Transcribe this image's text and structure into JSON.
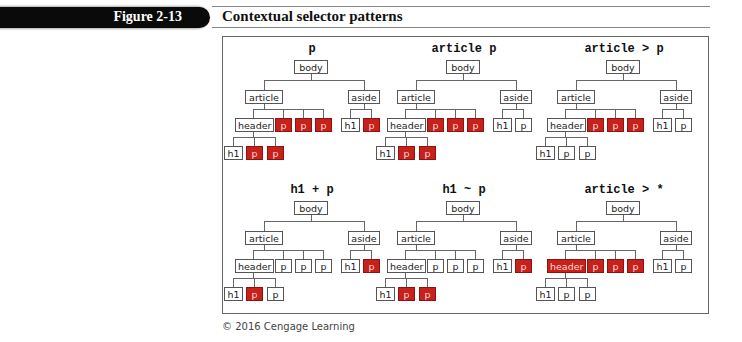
{
  "figure": {
    "label": "Figure 2-13",
    "title": "Contextual selector patterns",
    "credit": "© 2016 Cengage Learning"
  },
  "colors": {
    "highlight": "#c8201a",
    "header_bar": "#0a0a0a"
  },
  "tree_labels": {
    "body": "body",
    "article": "article",
    "aside": "aside",
    "header": "header",
    "h1": "h1",
    "p": "p"
  },
  "panels": [
    {
      "selector": "p",
      "highlighted": [
        "article.p1",
        "article.p2",
        "article.p3",
        "header.p1",
        "header.p2",
        "aside.p"
      ]
    },
    {
      "selector": "article p",
      "highlighted": [
        "article.p1",
        "article.p2",
        "article.p3",
        "header.p1",
        "header.p2"
      ]
    },
    {
      "selector": "article > p",
      "highlighted": [
        "article.p1",
        "article.p2",
        "article.p3"
      ]
    },
    {
      "selector": "h1 + p",
      "highlighted": [
        "header.p1",
        "aside.p"
      ]
    },
    {
      "selector": "h1 ~ p",
      "highlighted": [
        "header.p1",
        "header.p2",
        "aside.p"
      ]
    },
    {
      "selector": "article > *",
      "highlighted": [
        "article.header",
        "article.p1",
        "article.p2",
        "article.p3"
      ]
    }
  ]
}
